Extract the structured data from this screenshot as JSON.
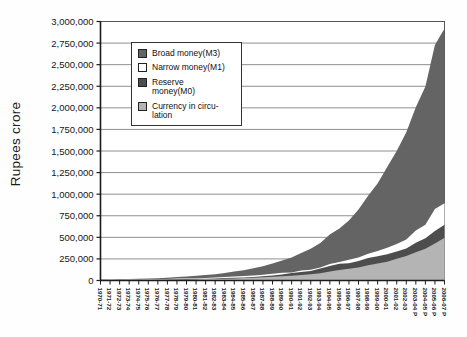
{
  "chart_data": {
    "type": "area",
    "title": "",
    "xlabel": "",
    "ylabel": "Rupees crore",
    "ylim": [
      0,
      3000000
    ],
    "ytick_step": 250000,
    "ytick_labels": [
      "0",
      "250,000",
      "500,000",
      "750,000",
      "1,000,000",
      "1,250,000",
      "1,500,000",
      "1,750,000",
      "2,000,000",
      "2,250,000",
      "2,500,000",
      "2,750,000",
      "3,000,000"
    ],
    "grid": true,
    "legend_position": "upper-left-inside",
    "overlapping_series": true,
    "categories": [
      "1970-71",
      "1971-72",
      "1972-73",
      "1973-74",
      "1974-75",
      "1975-76",
      "1976-77",
      "1977-78",
      "1978-79",
      "1979-80",
      "1980-81",
      "1981-82",
      "1982-83",
      "1983-84",
      "1984-85",
      "1985-86",
      "1986-87",
      "1987-88",
      "1988-89",
      "1989-90",
      "1990-91",
      "1991-92",
      "1992-93",
      "1993-94",
      "1994-95",
      "1995-96",
      "1996-97",
      "1997-98",
      "1998-99",
      "1999-00",
      "2000-01",
      "2001-02",
      "2002-03",
      "2003-04 P",
      "2004-05 P",
      "2005-06 P",
      "2006-07 P"
    ],
    "series": [
      {
        "name": "Broad money(M3)",
        "color": "#646464",
        "values": [
          11020,
          12674,
          14845,
          17126,
          19456,
          22675,
          27047,
          32104,
          38929,
          46950,
          55774,
          62752,
          73224,
          86523,
          102790,
          119394,
          141835,
          164545,
          196000,
          230950,
          265828,
          317049,
          366825,
          434407,
          531426,
          604007,
          696012,
          821332,
          980960,
          1124174,
          1313220,
          1498355,
          1717960,
          2005676,
          2245677,
          2729535,
          2920000
        ]
      },
      {
        "name": "Narrow money(M1)",
        "color": "#ffffff",
        "values": [
          7320,
          8249,
          9600,
          11040,
          11971,
          13527,
          15823,
          18204,
          21540,
          24224,
          27100,
          29700,
          33900,
          39600,
          45700,
          51600,
          58800,
          66400,
          77900,
          89800,
          92892,
          114406,
          124066,
          149266,
          192257,
          214835,
          240815,
          267844,
          309068,
          341796,
          379450,
          422843,
          473581,
          578372,
          646263,
          826539,
          895000
        ]
      },
      {
        "name": "Reserve money(M0)",
        "color": "#4d4d4d",
        "values": [
          4708,
          5218,
          6140,
          7205,
          7834,
          8510,
          10441,
          12322,
          14789,
          18195,
          19452,
          21017,
          23532,
          28000,
          31600,
          35300,
          41000,
          48200,
          57500,
          69900,
          87779,
          99505,
          110954,
          138691,
          169290,
          194571,
          199985,
          226402,
          259329,
          280541,
          303398,
          337047,
          369061,
          436512,
          489499,
          573066,
          645000
        ]
      },
      {
        "name": "Currency in circulation",
        "color": "#b4b4b4",
        "values": [
          4400,
          4930,
          5520,
          6180,
          6580,
          7170,
          8280,
          9440,
          10960,
          12510,
          14507,
          15970,
          18170,
          21270,
          24410,
          27600,
          31920,
          37060,
          43290,
          49960,
          55282,
          63738,
          71326,
          84120,
          103838,
          122825,
          137217,
          151055,
          175846,
          197061,
          218205,
          250974,
          282473,
          327028,
          368661,
          429578,
          495000
        ]
      }
    ]
  },
  "legend": {
    "items": [
      {
        "label": "Broad money(M3)"
      },
      {
        "label": "Narrow money(M1)"
      },
      {
        "label": "Reserve money(M0)"
      },
      {
        "label": "Currency in circu-lation"
      }
    ]
  }
}
